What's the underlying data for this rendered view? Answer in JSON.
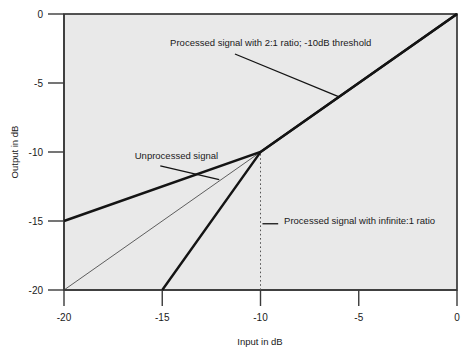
{
  "chart_data": {
    "type": "line",
    "title": "",
    "subtitle": "",
    "xlabel": "Input in dB",
    "ylabel": "Output in dB",
    "xlim": [
      -20,
      0
    ],
    "ylim": [
      -20,
      0
    ],
    "xticks": [
      -20,
      -15,
      -10,
      -5,
      0
    ],
    "xticklabels": [
      "-20",
      "-15",
      "-10",
      "-5",
      "0"
    ],
    "yticks": [
      -20,
      -15,
      -10,
      -5,
      0
    ],
    "yticklabels": [
      "-20",
      "-15",
      "-10",
      "-5",
      "0"
    ],
    "grid": false,
    "legend_position": "inline-annotations",
    "plot_background": "#e9e9e9",
    "series": [
      {
        "name": "Unprocessed signal",
        "style": "thin-solid",
        "color": "#3a3a3a",
        "linewidth": 0.8,
        "x": [
          -20,
          0
        ],
        "y": [
          -20,
          0
        ]
      },
      {
        "name": "Processed signal with 2:1 ratio; -10dB threshold",
        "style": "thick-solid",
        "color": "#141414",
        "linewidth": 2.4,
        "x": [
          -20,
          -10,
          0
        ],
        "y": [
          -15,
          -10,
          0
        ]
      },
      {
        "name": "Processed signal with infinite:1 ratio",
        "style": "thick-solid",
        "color": "#141414",
        "linewidth": 2.4,
        "x": [
          -15,
          -10,
          0
        ],
        "y": [
          -20,
          -10,
          0
        ]
      },
      {
        "name": "threshold marker",
        "style": "dotted-vertical",
        "color": "#555555",
        "linewidth": 1,
        "x": [
          -10,
          -10
        ],
        "y": [
          -20,
          -10
        ]
      }
    ],
    "annotations": [
      {
        "id": "annot-2to1",
        "text": "Processed signal with 2:1 ratio; -10dB threshold",
        "text_anchor_xy": [
          -14.6,
          -2.3
        ],
        "leader_from_xy": [
          -11.3,
          -2.9
        ],
        "leader_to_xy": [
          -6.0,
          -6.0
        ]
      },
      {
        "id": "annot-unprocessed",
        "text": "Unprocessed signal",
        "text_anchor_xy": [
          -16.4,
          -10.5
        ],
        "leader_from_xy": [
          -15.1,
          -11.0
        ],
        "leader_to_xy": [
          -12.1,
          -12.0
        ]
      },
      {
        "id": "annot-infinite",
        "text": "Processed signal with infinite:1 ratio",
        "text_anchor_xy": [
          -8.8,
          -15.2
        ],
        "leader_from_xy": [
          -9.9,
          -15.2
        ],
        "leader_to_xy": [
          -9.1,
          -15.2
        ]
      }
    ]
  },
  "axes": {
    "x_title": "Input in dB",
    "y_title": "Output in dB",
    "x_ticks": [
      "-20",
      "-15",
      "-10",
      "-5",
      "0"
    ],
    "y_ticks": [
      "0",
      "-5",
      "-10",
      "-15",
      "-20"
    ]
  },
  "annotation_texts": {
    "two_to_one": "Processed signal with 2:1 ratio; -10dB threshold",
    "unprocessed": "Unprocessed signal",
    "infinite": "Processed signal with infinite:1 ratio"
  }
}
